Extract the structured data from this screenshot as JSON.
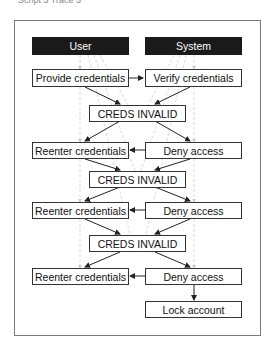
{
  "caption": "Script 3 Trace 5",
  "lanes": [
    {
      "id": "user",
      "label": "User"
    },
    {
      "id": "system",
      "label": "System"
    }
  ],
  "nodes": [
    {
      "id": "n1",
      "label": "Provide credentials",
      "lane": "user"
    },
    {
      "id": "n2",
      "label": "Verify credentials",
      "lane": "system"
    },
    {
      "id": "n3",
      "label": "CREDS INVALID",
      "lane": "shared"
    },
    {
      "id": "n4",
      "label": "Reenter credentials",
      "lane": "user"
    },
    {
      "id": "n5",
      "label": "Deny access",
      "lane": "system"
    },
    {
      "id": "n6",
      "label": "CREDS INVALID",
      "lane": "shared"
    },
    {
      "id": "n7",
      "label": "Reenter credentials",
      "lane": "user"
    },
    {
      "id": "n8",
      "label": "Deny access",
      "lane": "system"
    },
    {
      "id": "n9",
      "label": "CREDS INVALID",
      "lane": "shared"
    },
    {
      "id": "n10",
      "label": "Reenter credentials",
      "lane": "user"
    },
    {
      "id": "n11",
      "label": "Deny access",
      "lane": "system"
    },
    {
      "id": "n12",
      "label": "Lock account",
      "lane": "system"
    }
  ],
  "edges": [
    [
      "n1",
      "n2"
    ],
    [
      "n1",
      "n3"
    ],
    [
      "n2",
      "n3"
    ],
    [
      "n3",
      "n4"
    ],
    [
      "n3",
      "n5"
    ],
    [
      "n5",
      "n4"
    ],
    [
      "n4",
      "n6"
    ],
    [
      "n5",
      "n6"
    ],
    [
      "n6",
      "n7"
    ],
    [
      "n6",
      "n8"
    ],
    [
      "n8",
      "n7"
    ],
    [
      "n7",
      "n9"
    ],
    [
      "n8",
      "n9"
    ],
    [
      "n9",
      "n10"
    ],
    [
      "n9",
      "n11"
    ],
    [
      "n11",
      "n10"
    ],
    [
      "n11",
      "n12"
    ]
  ],
  "colors": {
    "lane_header": "#1a1a1a",
    "edge": "#222222",
    "trace_edge": "#c8c8c8",
    "frame": "#7a7a7a"
  }
}
